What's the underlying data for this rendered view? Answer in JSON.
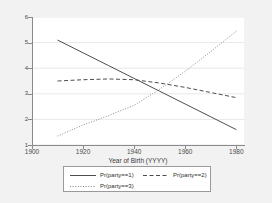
{
  "chart_data": {
    "type": "line",
    "title": "",
    "xlabel": "Year of Birth (YYYY)",
    "ylabel": "",
    "xlim": [
      1900,
      1983
    ],
    "ylim": [
      1,
      6
    ],
    "xticks": [
      1900,
      1920,
      1940,
      1960,
      1980
    ],
    "yticks": [
      1,
      2,
      3,
      4,
      5,
      6
    ],
    "grid": "horizontal",
    "legend_position": "bottom",
    "series": [
      {
        "name": "Pr(party==1)",
        "style": "solid",
        "color": "#4d4d4d",
        "x": [
          1910,
          1920,
          1930,
          1940,
          1950,
          1960,
          1970,
          1980
        ],
        "values": [
          5.1,
          4.6,
          4.1,
          3.6,
          3.1,
          2.6,
          2.1,
          1.6
        ]
      },
      {
        "name": "Pr(party==2)",
        "style": "dashed",
        "color": "#4d4d4d",
        "x": [
          1910,
          1920,
          1930,
          1940,
          1950,
          1960,
          1970,
          1980
        ],
        "values": [
          3.5,
          3.55,
          3.58,
          3.55,
          3.42,
          3.25,
          3.05,
          2.85
        ]
      },
      {
        "name": "Pr(party==3)",
        "style": "dotted",
        "color": "#8c8c8c",
        "x": [
          1910,
          1920,
          1930,
          1940,
          1950,
          1960,
          1970,
          1980
        ],
        "values": [
          1.35,
          1.78,
          2.15,
          2.55,
          3.18,
          3.88,
          4.65,
          5.45
        ]
      }
    ]
  },
  "axes": {
    "ytick_labels": [
      "6",
      "5",
      "4",
      "3",
      "2",
      "1"
    ],
    "xtick_labels": [
      "1900",
      "1920",
      "1940",
      "1960",
      "1980"
    ],
    "x_title": "Year of Birth (YYYY)"
  },
  "legend": {
    "items": [
      {
        "label": "Pr(party==1)",
        "style": "solid"
      },
      {
        "label": "Pr(party==2)",
        "style": "dashed"
      },
      {
        "label": "Pr(party==3)",
        "style": "dotted"
      }
    ]
  },
  "colors": {
    "figure_background": "#f2f2f2",
    "plot_background": "#ffffff",
    "gridline": "#e8e8e8",
    "axis": "#8a8a8a",
    "series_1": "#4d4d4d",
    "series_2": "#4d4d4d",
    "series_3": "#8c8c8c",
    "text": "#3a3a3a"
  }
}
